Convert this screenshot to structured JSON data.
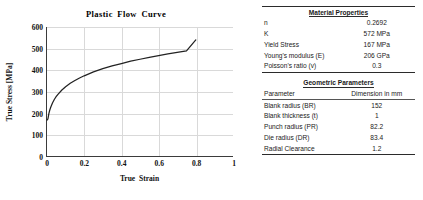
{
  "chart_data": {
    "type": "line",
    "title": "Plastic Flow Curve",
    "xlabel": "True Strain",
    "ylabel": "True Stress [MPa]",
    "xlim": [
      0,
      1
    ],
    "ylim": [
      0,
      600
    ],
    "xticks": [
      "0",
      "0.2",
      "0.4",
      "0.6",
      "0.8",
      "1"
    ],
    "xtick_values": [
      0,
      0.2,
      0.4,
      0.6,
      0.8,
      1
    ],
    "yticks": [
      "0",
      "100",
      "200",
      "300",
      "400",
      "500",
      "600"
    ],
    "ytick_values": [
      0,
      100,
      200,
      300,
      400,
      500,
      600
    ],
    "grid": true,
    "legend": "none",
    "series": [
      {
        "name": "True stress-strain (Hollomon K=572, n=0.2692)",
        "color": "#222222",
        "x": [
          0.0,
          0.005,
          0.01,
          0.015,
          0.02,
          0.03,
          0.04,
          0.05,
          0.06,
          0.08,
          0.1,
          0.125,
          0.15,
          0.175,
          0.2,
          0.25,
          0.3,
          0.35,
          0.4,
          0.45,
          0.5,
          0.55,
          0.6,
          0.65,
          0.7,
          0.75,
          0.8
        ],
        "y": [
          167,
          173,
          197,
          214,
          227,
          248,
          264,
          277,
          288,
          307,
          322,
          338,
          351,
          363,
          373,
          391,
          406,
          419,
          430,
          441,
          450,
          459,
          467,
          475,
          482,
          489,
          540
        ]
      }
    ]
  },
  "material_table": {
    "caption": "Material Properties",
    "rows": [
      {
        "label": "n",
        "value": "0.2692"
      },
      {
        "label": "K",
        "value": "572 MPa"
      },
      {
        "label": "Yield Stress",
        "value": "167 MPa"
      },
      {
        "label": "Young's modulus (E)",
        "value": "206 GPa"
      },
      {
        "label": "Poisson's ratio (v)",
        "value": "0.3"
      }
    ]
  },
  "geometric_table": {
    "caption": "Geometric Parameters",
    "header": {
      "label": "Parameter",
      "value": "Dimension in mm"
    },
    "rows": [
      {
        "label": "Blank radius (BR)",
        "value": "152"
      },
      {
        "label": "Blank thickness (t)",
        "value": "1"
      },
      {
        "label": "Punch radius (PR)",
        "value": "82.2"
      },
      {
        "label": "Die radius (DR)",
        "value": "83.4"
      },
      {
        "label": "Radial Clearance",
        "value": "1.2"
      }
    ]
  }
}
